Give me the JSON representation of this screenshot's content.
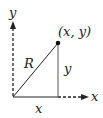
{
  "diagram": {
    "labels": {
      "y_axis": "y",
      "x_axis": "x",
      "point": "(x, y)",
      "hypotenuse": "R",
      "vertical_leg": "y",
      "horizontal_leg": "x"
    },
    "colors": {
      "line": "#222222",
      "axis": "#222222",
      "background": "#ffffff"
    }
  }
}
